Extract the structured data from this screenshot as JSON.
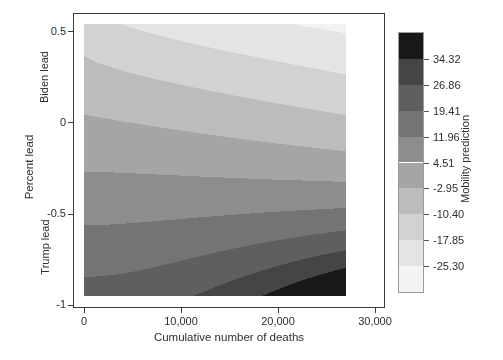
{
  "figure": {
    "x_axis": {
      "title": "Cumulative number of deaths",
      "ticks": [
        {
          "label": "0",
          "value": 0
        },
        {
          "label": "10,000",
          "value": 10000
        },
        {
          "label": "20,000",
          "value": 20000
        },
        {
          "label": "30,000",
          "value": 30000
        }
      ]
    },
    "y_axis": {
      "title": "Percent lead",
      "annotation_top": "Biden lead",
      "annotation_bottom": "Trump lead",
      "ticks": [
        {
          "label": "0.5",
          "value": 0.5
        },
        {
          "label": "0",
          "value": 0
        },
        {
          "label": "-0.5",
          "value": -0.5
        },
        {
          "label": "-1",
          "value": -1
        }
      ]
    },
    "colorbar_title": "Mobility prediction"
  },
  "chart_data": {
    "type": "heatmap",
    "subtype": "filled-contour",
    "title": "",
    "xlabel": "Cumulative number of deaths",
    "ylabel": "Percent lead",
    "legend_title": "Mobility prediction",
    "legend_position": "right",
    "grid": false,
    "x_data_range": [
      0,
      27000
    ],
    "x_axis_tick_values": [
      0,
      10000,
      20000,
      30000
    ],
    "y_data_range": [
      -0.951,
      0.538
    ],
    "y_axis_tick_values": [
      0.5,
      0,
      -0.5,
      -1
    ],
    "contour_breaks_low_to_high": [
      -32.76,
      -25.3,
      -17.85,
      -10.4,
      -2.95,
      4.51,
      11.96,
      19.41,
      26.86,
      34.32,
      41.77
    ],
    "colorbar_tick_labels_top_to_bottom": [
      "34.32",
      "26.86",
      "19.41",
      "11.96",
      "4.51",
      "-2.95",
      "-10.40",
      "-17.85",
      "-25.30"
    ],
    "colors_low_to_high": [
      "#f3f3f3",
      "#e4e4e4",
      "#d2d2d2",
      "#bcbcbc",
      "#a5a5a5",
      "#8d8d8d",
      "#747474",
      "#5f5f5f",
      "#454545",
      "#191919"
    ],
    "approx_corner_values": {
      "top_left": -14,
      "top_right": -27,
      "bottom_left": 22,
      "bottom_right": 45,
      "note": "Mobility prediction decreases with deaths under Biden lead, increases with deaths under Trump lead; darkest (highest) region at bottom-right, lightest (lowest) at top-right."
    },
    "surface_model": {
      "comment": "z(s,v): s = deaths/27000 in [0,1]; v = percent lead in [v_bottom, v_top]. z = zL(v) + (zR(v)-zL(v)) * s^p(v). Coefficients fitted to the contour band positions in the figure.",
      "v_top": 0.538,
      "v_bottom": -0.951,
      "zL_coeffs": [
        -2.0,
        -23.6,
        2.0
      ],
      "zR_coeffs": [
        -9.0,
        -36.0,
        12.0,
        -14.0
      ],
      "p_coeffs": [
        0.6,
        0.9,
        0.58
      ]
    }
  }
}
